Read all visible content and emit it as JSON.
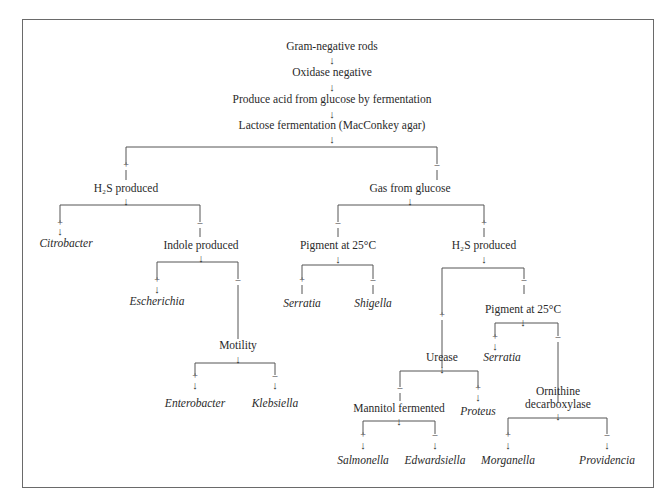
{
  "diagram": {
    "type": "identification-flowchart",
    "nodes": {
      "root": "Gram-negative rods",
      "oxidase": "Oxidase negative",
      "glucose_acid": "Produce acid from glucose by fermentation",
      "lactose": "Lactose fermentation (MacConkey agar)",
      "h2s_left": "H₂S produced",
      "gas": "Gas from glucose",
      "citrobacter": "Citrobacter",
      "indole": "Indole produced",
      "escherichia": "Escherichia",
      "motility": "Motility",
      "enterobacter": "Enterobacter",
      "klebsiella": "Klebsiella",
      "pigment_a": "Pigment at 25°C",
      "serratia_a": "Serratia",
      "shigella": "Shigella",
      "h2s_right": "H₂S produced",
      "urease": "Urease",
      "pigment_b": "Pigment at 25°C",
      "serratia_b": "Serratia",
      "mannitol": "Mannitol fermented",
      "proteus": "Proteus",
      "ornithine_1": "Ornithine",
      "ornithine_2": "decarboxylase",
      "salmonella": "Salmonella",
      "edwardsiella": "Edwardsiella",
      "morganella": "Morganella",
      "providencia": "Providencia"
    },
    "symbols": {
      "plus": "+",
      "minus": "–",
      "arrow": "↓"
    },
    "colors": {
      "line": "#555555",
      "text": "#2a2a2a",
      "border": "#6a6a6a"
    }
  }
}
